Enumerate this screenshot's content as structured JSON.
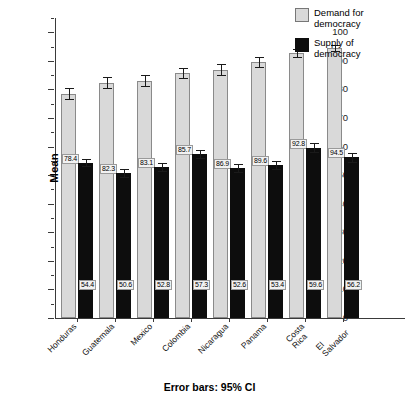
{
  "chart_data": {
    "type": "bar",
    "title": "",
    "xlabel": "",
    "ylabel": "Mean",
    "ylim": [
      0,
      105
    ],
    "ytick_step": 10,
    "yticks": [
      "0",
      "10",
      "20",
      "30",
      "40",
      "50",
      "60",
      "70",
      "80",
      "90",
      "100"
    ],
    "grid": false,
    "legend_position": "top-right",
    "categories": [
      "Honduras",
      "Guatemala",
      "Mexico",
      "Colombia",
      "Nicaragua",
      "Panama",
      "Costa Rica",
      "El Salvador"
    ],
    "category_lines": [
      [
        "Honduras"
      ],
      [
        "Guatemala"
      ],
      [
        "Mexico"
      ],
      [
        "Colombia"
      ],
      [
        "Nicaragua"
      ],
      [
        "Panama"
      ],
      [
        "Costa",
        "Rica"
      ],
      [
        "El",
        "Salvador"
      ]
    ],
    "series": [
      {
        "name": "Demand for democracy",
        "color": "#d9d9d9",
        "values": [
          78.4,
          82.3,
          83.1,
          85.7,
          86.9,
          89.6,
          92.8,
          94.5
        ],
        "labels": [
          "78.4",
          "82.3",
          "83.1",
          "85.7",
          "86.9",
          "89.6",
          "92.8",
          "94.5"
        ],
        "ci_low": [
          76.5,
          80.4,
          81.3,
          83.9,
          85.1,
          88.0,
          91.5,
          93.4
        ],
        "ci_high": [
          80.4,
          84.3,
          84.9,
          87.6,
          88.8,
          91.3,
          94.1,
          95.7
        ]
      },
      {
        "name": "Supply of democracy",
        "color": "#0d0d0d",
        "values": [
          54.4,
          50.6,
          52.8,
          57.3,
          52.6,
          53.4,
          59.6,
          56.2
        ],
        "labels": [
          "54.4",
          "50.6",
          "52.8",
          "57.3",
          "52.6",
          "53.4",
          "59.6",
          "56.2"
        ],
        "ci_low": [
          53.1,
          49.2,
          51.3,
          55.9,
          51.2,
          52.0,
          58.1,
          54.6
        ],
        "ci_high": [
          55.7,
          52.0,
          54.3,
          58.7,
          54.0,
          54.8,
          61.1,
          57.8
        ]
      }
    ],
    "caption": "Error bars: 95% CI",
    "errorbar_note": "95% CI"
  },
  "legend": {
    "items": [
      {
        "label_line1": "Demand for",
        "label_line2": "democracy",
        "swatch": "demand-swatch"
      },
      {
        "label_line1": "Supply of",
        "label_line2": "democracy",
        "swatch": "supply-swatch"
      }
    ]
  },
  "axis": {
    "y_title": "Mean"
  },
  "caption": {
    "text": "Error bars: 95% CI"
  }
}
